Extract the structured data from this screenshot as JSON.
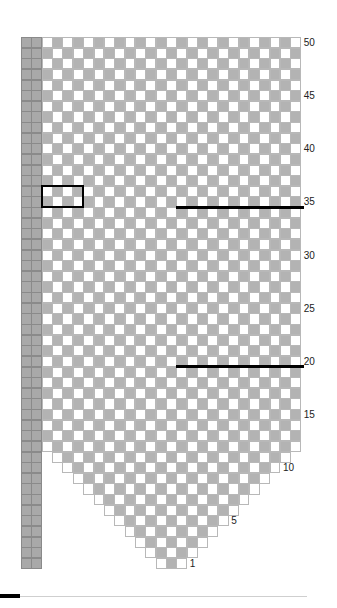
{
  "chart_data": {
    "type": "table",
    "title": "",
    "rows": 50,
    "pattern_columns": 25,
    "edge_columns": 2,
    "taper_rule": "row_width = min(25, 2*row + 1)",
    "cell_colors": {
      "light": "#ffffff",
      "dark": "#b3b3b3",
      "edge": "#a9a9a9"
    },
    "row_labels": [
      1,
      5,
      10,
      15,
      20,
      25,
      30,
      35,
      40,
      45,
      50
    ],
    "markers": [
      {
        "type": "line",
        "row_boundary_above": 34,
        "from_col": 13,
        "to_col": 25,
        "label": "line at row 35"
      },
      {
        "type": "line",
        "row_boundary_above": 19,
        "from_col": 13,
        "to_col": 25,
        "label": "line at row 20"
      },
      {
        "type": "box",
        "rows": [
          35,
          36
        ],
        "cols": [
          0,
          3
        ],
        "label": "repeat box"
      }
    ]
  },
  "footer": {
    "accent_color": "#000000"
  }
}
